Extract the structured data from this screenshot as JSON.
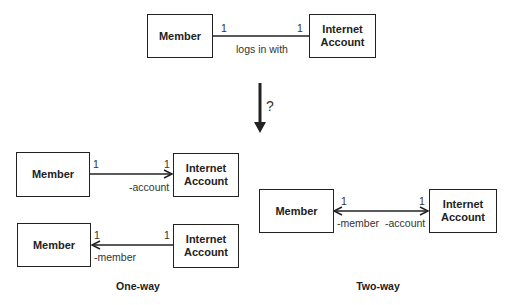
{
  "top": {
    "left_class": "Member",
    "right_class": "Internet\nAccount",
    "left_multiplicity": "1",
    "right_multiplicity": "1",
    "association_name": "logs in with"
  },
  "transition": {
    "symbol": "?"
  },
  "one_way": {
    "caption": "One-way",
    "first": {
      "left_class": "Member",
      "right_class": "Internet\nAccount",
      "left_multiplicity": "1",
      "right_multiplicity": "1",
      "role": "-account",
      "direction": "left-to-right"
    },
    "second": {
      "left_class": "Member",
      "right_class": "Internet\nAccount",
      "left_multiplicity": "1",
      "right_multiplicity": "1",
      "role": "-member",
      "direction": "right-to-left"
    }
  },
  "two_way": {
    "caption": "Two-way",
    "left_class": "Member",
    "right_class": "Internet\nAccount",
    "left_multiplicity": "1",
    "right_multiplicity": "1",
    "left_role": "-member",
    "right_role": "-account",
    "direction": "bidirectional"
  }
}
